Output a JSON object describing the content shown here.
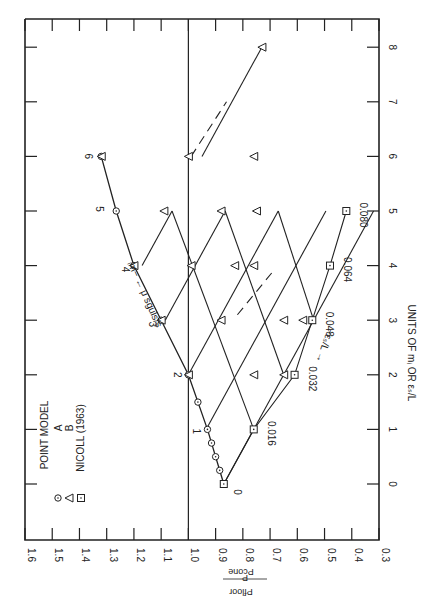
{
  "chart_data": {
    "type": "line",
    "orientation_note": "figure printed rotated 90 degrees clockwise",
    "xlabel": "UNITS OF m_I OR ε_s/L",
    "ylabel": "P_Floor / P_cone",
    "x_ticks": [
      0,
      1,
      2,
      3,
      4,
      5,
      6,
      7,
      8
    ],
    "y_ticks": [
      1.6,
      1.5,
      1.4,
      1.3,
      1.2,
      1.1,
      1.0,
      0.9,
      0.8,
      0.7,
      0.6,
      0.5,
      0.4,
      0.3
    ],
    "xlim": [
      -0.6,
      8.5
    ],
    "ylim": [
      0.3,
      1.6
    ],
    "reference_line": {
      "y": 1.0
    },
    "legend": {
      "title": "POINT MODEL",
      "entries": [
        {
          "marker": "circle-dot",
          "label": "A"
        },
        {
          "marker": "triangle",
          "label": "B"
        },
        {
          "marker": "square-dot",
          "label": "NICOLL (1963)"
        }
      ]
    },
    "annotations": {
      "m_axis_label": "−m_I ← μ slugs/s",
      "eps_axis_label": "−ε_s/L →",
      "m_labels": [
        "0",
        "1",
        "2",
        "3",
        "4",
        "5",
        "6"
      ],
      "eps_labels": [
        "0.016",
        "0.032",
        "0.048",
        "0.064",
        "0.080"
      ]
    },
    "series": [
      {
        "name": "A (m_I path)",
        "marker": "circle-dot",
        "points": [
          [
            0,
            0.87
          ],
          [
            0.25,
            0.885
          ],
          [
            0.5,
            0.9
          ],
          [
            0.75,
            0.915
          ],
          [
            1,
            0.93
          ],
          [
            1.5,
            0.965
          ],
          [
            2,
            1.0
          ],
          [
            3,
            1.1
          ],
          [
            4,
            1.2
          ],
          [
            5,
            1.265
          ],
          [
            6,
            1.32
          ]
        ]
      },
      {
        "name": "B lattice nodes",
        "marker": "triangle",
        "points": [
          [
            2,
            1.0
          ],
          [
            3,
            1.1
          ],
          [
            4,
            1.2
          ],
          [
            6,
            1.32
          ],
          [
            2,
            0.76
          ],
          [
            3,
            0.88
          ],
          [
            4,
            0.99
          ],
          [
            5,
            1.09
          ],
          [
            6,
            1.0
          ],
          [
            3,
            0.65
          ],
          [
            4,
            0.76
          ],
          [
            5,
            0.88
          ],
          [
            4,
            0.83
          ],
          [
            5,
            0.75
          ],
          [
            6,
            0.76
          ],
          [
            2,
            0.65
          ],
          [
            3,
            0.58
          ],
          [
            8,
            0.73
          ]
        ]
      },
      {
        "name": "NICOLL (1963)",
        "marker": "square-dot",
        "points": [
          [
            0,
            0.87
          ],
          [
            1,
            0.76
          ],
          [
            2,
            0.61
          ],
          [
            3,
            0.545
          ],
          [
            4,
            0.48
          ],
          [
            5,
            0.42
          ]
        ],
        "labels": [
          "0",
          "0.016",
          "0.032",
          "0.048",
          "0.064",
          "0.080"
        ]
      }
    ]
  }
}
